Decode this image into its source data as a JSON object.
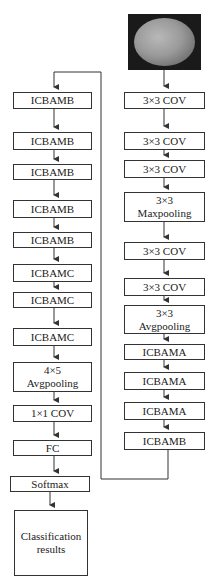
{
  "input_image": {
    "description": "grayscale textured ellipse on dark background"
  },
  "right_column": [
    {
      "label": "3×3 COV"
    },
    {
      "label": "3×3 COV"
    },
    {
      "label": "3×3 COV"
    },
    {
      "line1": "3×3",
      "line2": "Maxpooling"
    },
    {
      "label": "3×3 COV"
    },
    {
      "label": "3×3 COV"
    },
    {
      "line1": "3×3",
      "line2": "Avgpooling"
    },
    {
      "label": "ICBAMA"
    },
    {
      "label": "ICBAMA"
    },
    {
      "label": "ICBAMA"
    },
    {
      "label": "ICBAMB"
    }
  ],
  "left_column": [
    {
      "label": "ICBAMB"
    },
    {
      "label": "ICBAMB"
    },
    {
      "label": "ICBAMB"
    },
    {
      "label": "ICBAMB"
    },
    {
      "label": "ICBAMB"
    },
    {
      "label": "ICBAMC"
    },
    {
      "label": "ICBAMC"
    },
    {
      "label": "ICBAMC"
    },
    {
      "line1": "4×5",
      "line2": "Avgpooling"
    },
    {
      "label": "1×1 COV"
    },
    {
      "label": "FC"
    },
    {
      "label": "Softmax"
    },
    {
      "line1": "Classification",
      "line2": "results"
    }
  ],
  "colors": {
    "line": "#333333",
    "box_border": "#333333",
    "background": "#ffffff"
  }
}
